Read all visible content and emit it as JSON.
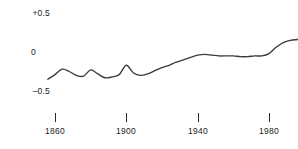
{
  "chart_data": {
    "type": "line",
    "title": "",
    "subtitle": "",
    "xlabel": "",
    "ylabel": "",
    "xlim": [
      1855,
      2000
    ],
    "ylim": [
      -0.5,
      0.5
    ],
    "grid": false,
    "legend": null,
    "y_ticks": [
      {
        "value": 0.5,
        "label": "+0.5"
      },
      {
        "value": 0.0,
        "label": "0"
      },
      {
        "value": -0.5,
        "label": "–0.5"
      }
    ],
    "x_ticks": [
      {
        "value": 1860,
        "label": "1860"
      },
      {
        "value": 1900,
        "label": "1900"
      },
      {
        "value": 1940,
        "label": "1940"
      },
      {
        "value": 1980,
        "label": "1980"
      }
    ],
    "series": [
      {
        "name": "anomaly",
        "color": "#3a3a3a",
        "x": [
          1856,
          1860,
          1864,
          1868,
          1872,
          1876,
          1880,
          1884,
          1888,
          1892,
          1896,
          1900,
          1904,
          1908,
          1912,
          1916,
          1920,
          1924,
          1928,
          1932,
          1936,
          1940,
          1944,
          1948,
          1952,
          1956,
          1960,
          1964,
          1968,
          1972,
          1976,
          1980,
          1984,
          1988,
          1992,
          1996,
          2000
        ],
        "values": [
          -0.35,
          -0.29,
          -0.22,
          -0.25,
          -0.3,
          -0.31,
          -0.23,
          -0.28,
          -0.33,
          -0.32,
          -0.29,
          -0.17,
          -0.27,
          -0.3,
          -0.28,
          -0.24,
          -0.2,
          -0.17,
          -0.13,
          -0.1,
          -0.07,
          -0.04,
          -0.03,
          -0.04,
          -0.05,
          -0.05,
          -0.05,
          -0.06,
          -0.06,
          -0.05,
          -0.05,
          -0.02,
          0.06,
          0.12,
          0.15,
          0.16,
          0.17
        ]
      }
    ]
  }
}
